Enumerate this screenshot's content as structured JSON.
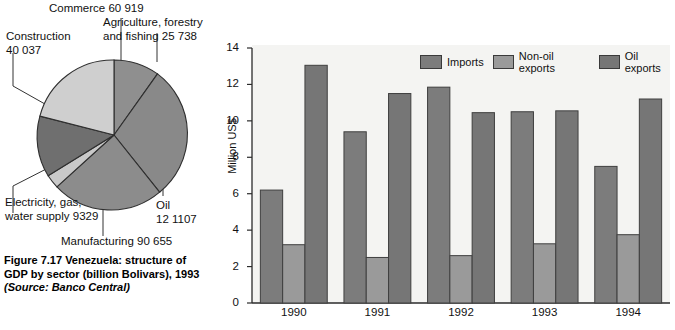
{
  "figure": {
    "caption_line1": "Figure 7.17  Venezuela: structure of",
    "caption_line2": "GDP by sector (billion Bolivars), 1993",
    "caption_line3": "(Source: Banco Central)"
  },
  "pie_labels": {
    "commerce": "Commerce 60 919",
    "agriculture": "Agriculture, forestry\nand fishing 25 738",
    "construction": "Construction\n40 037",
    "electricity": "Electricity, gas,\nwater supply 9329",
    "oil": "Oil\n12 1107",
    "manufacturing": "Manufacturing 90 655"
  },
  "legend": {
    "items": [
      {
        "label": "Imports",
        "color": "#7c7c7c"
      },
      {
        "label": "Non-oil exports",
        "color": "#9a9a9a"
      },
      {
        "label": "Oil exports",
        "color": "#767676"
      }
    ]
  },
  "chart_data": [
    {
      "type": "pie",
      "title": "Venezuela: structure of GDP by sector (billion Bolivars), 1993",
      "unit": "billion Bolivars",
      "labels": [
        "Agriculture, forestry and fishing",
        "Oil",
        "Manufacturing",
        "Electricity, gas, water supply",
        "Construction",
        "Commerce"
      ],
      "values": [
        25738,
        121107,
        90655,
        9329,
        40037,
        60919
      ],
      "colors": [
        "#8f8f8f",
        "#898989",
        "#8c8c8c",
        "#c9c9c9",
        "#6f6f6f",
        "#cfcfcf"
      ],
      "legend": "labels-with-leader-lines"
    },
    {
      "type": "bar",
      "title": "",
      "xlabel": "",
      "ylabel": "Million US$",
      "categories": [
        "1990",
        "1991",
        "1992",
        "1993",
        "1994"
      ],
      "ylim": [
        0,
        14
      ],
      "yticks": [
        0,
        2,
        4,
        6,
        8,
        10,
        12,
        14
      ],
      "grid": false,
      "legend_position": "top-right",
      "series": [
        {
          "name": "Imports",
          "color": "#7c7c7c",
          "values": [
            6.2,
            9.4,
            11.85,
            10.5,
            7.5
          ]
        },
        {
          "name": "Non-oil exports",
          "color": "#9a9a9a",
          "values": [
            3.2,
            2.5,
            2.6,
            3.25,
            3.75
          ]
        },
        {
          "name": "Oil exports",
          "color": "#767676",
          "values": [
            13.05,
            11.5,
            10.45,
            10.55,
            11.2
          ]
        }
      ]
    }
  ]
}
